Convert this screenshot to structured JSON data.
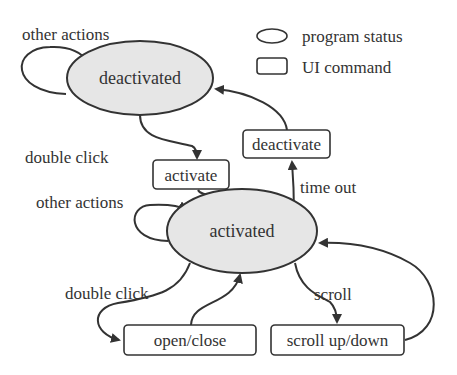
{
  "legend": {
    "items": [
      {
        "shape": "ellipse",
        "label": "program status"
      },
      {
        "shape": "rounded-rect",
        "label": "UI command"
      }
    ]
  },
  "states": {
    "deactivated": "deactivated",
    "activated": "activated"
  },
  "commands": {
    "activate": "activate",
    "deactivate": "deactivate",
    "open_close": "open/close",
    "scroll_up_down": "scroll up/down"
  },
  "edge_labels": {
    "other_actions_top": "other actions",
    "double_click_top": "double click",
    "other_actions_mid": "other actions",
    "time_out": "time out",
    "double_click_bottom": "double click",
    "scroll": "scroll"
  },
  "colors": {
    "state_fill": "#e6e6e6",
    "stroke": "#333333",
    "background": "#ffffff"
  }
}
